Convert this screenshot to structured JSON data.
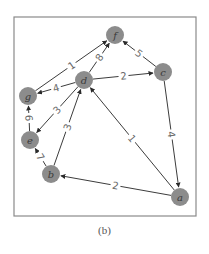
{
  "figure": {
    "caption": "(b)",
    "frame": {
      "x": 14,
      "y": 17,
      "width": 182,
      "height": 199,
      "stroke": "#8a8a8a"
    },
    "node_fill": "#8c8c8c",
    "node_label_color": "#3a3a3a",
    "edge_color": "#3c3c3c",
    "label_color": "#6a6a6a",
    "node_radius": 9
  },
  "graph": {
    "directed": true,
    "nodes": [
      {
        "id": "f",
        "label": "f",
        "x": 115,
        "y": 35
      },
      {
        "id": "c",
        "label": "c",
        "x": 163,
        "y": 72
      },
      {
        "id": "d",
        "label": "d",
        "x": 84,
        "y": 80
      },
      {
        "id": "g",
        "label": "g",
        "x": 28,
        "y": 96
      },
      {
        "id": "e",
        "label": "e",
        "x": 30,
        "y": 140
      },
      {
        "id": "b",
        "label": "b",
        "x": 51,
        "y": 174
      },
      {
        "id": "a",
        "label": "a",
        "x": 180,
        "y": 197
      }
    ],
    "edges": [
      {
        "from": "g",
        "to": "f",
        "weight": "1"
      },
      {
        "from": "d",
        "to": "f",
        "weight": "8"
      },
      {
        "from": "c",
        "to": "f",
        "weight": "5"
      },
      {
        "from": "d",
        "to": "c",
        "weight": "2"
      },
      {
        "from": "d",
        "to": "g",
        "weight": "4"
      },
      {
        "from": "d",
        "to": "e",
        "weight": "3"
      },
      {
        "from": "b",
        "to": "d",
        "weight": "3"
      },
      {
        "from": "a",
        "to": "d",
        "weight": "1"
      },
      {
        "from": "c",
        "to": "a",
        "weight": "4"
      },
      {
        "from": "a",
        "to": "b",
        "weight": "2"
      },
      {
        "from": "e",
        "to": "g",
        "weight": "6"
      },
      {
        "from": "b",
        "to": "e",
        "weight": "7"
      }
    ]
  }
}
